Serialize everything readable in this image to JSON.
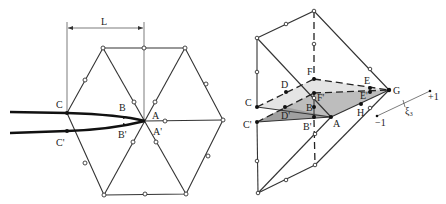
{
  "figure": {
    "left_panel": {
      "dimension_label": "L",
      "point_labels": {
        "C": "C",
        "C_prime": "C'",
        "B": "B",
        "B_prime": "B'",
        "A": "A",
        "A_prime": "A'"
      }
    },
    "right_panel": {
      "point_labels": {
        "C": "C",
        "C_prime": "C'",
        "D": "D",
        "D_prime": "D'",
        "B": "B",
        "B_prime": "B'",
        "F": "F",
        "F_prime": "F'",
        "A": "A",
        "E": "E",
        "E_prime": "E'",
        "H": "H",
        "G": "G"
      },
      "axis": {
        "minus": "−1",
        "plus": "+1",
        "symbol": "ξ₃"
      }
    },
    "colors": {
      "line": "#333333",
      "light_fill": "#e4e4e4",
      "dark_fill": "#a8a8a8"
    }
  }
}
